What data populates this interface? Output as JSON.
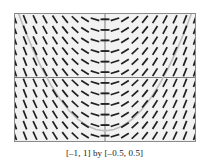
{
  "figure": {
    "caption": "[–1, 1] by [–0.5, 0.5]",
    "background_color": "#ffffff"
  },
  "chart_data": {
    "type": "scatter",
    "subtype": "slope-field",
    "title": "",
    "xlabel": "",
    "ylabel": "",
    "xlim": [
      -1,
      1
    ],
    "ylim": [
      -0.5,
      0.5
    ],
    "grid": false,
    "legend": null,
    "plot_background_color": "#f2f2f2",
    "frame_color": "#8a8a8a",
    "segment_color": "#1f1f1f",
    "curve_color": "#bdbdbd",
    "axes": {
      "x_axis_at_y": 0,
      "y_axis_at_x": 0,
      "axis_color": "#7d7d7d",
      "x_tick_count": 0,
      "y_tick_count": 11,
      "tick_color": "#555555"
    },
    "slope_field": {
      "equation": "dy/dx = 2x",
      "nx": 19,
      "ny": 12,
      "x_values": [
        -1,
        -0.889,
        -0.778,
        -0.667,
        -0.556,
        -0.444,
        -0.333,
        -0.222,
        -0.111,
        0,
        0.111,
        0.222,
        0.333,
        0.444,
        0.556,
        0.667,
        0.778,
        0.889,
        1
      ],
      "y_values": [
        0.458,
        0.375,
        0.292,
        0.208,
        0.125,
        0.042,
        -0.042,
        -0.125,
        -0.208,
        -0.292,
        -0.375,
        -0.458
      ],
      "slopes_by_x": [
        -2,
        -1.778,
        -1.556,
        -1.333,
        -1.111,
        -0.889,
        -0.667,
        -0.444,
        -0.222,
        0,
        0.222,
        0.444,
        0.667,
        0.889,
        1.111,
        1.333,
        1.556,
        1.778,
        2
      ],
      "segment_length_px": 9
    },
    "solution_curve": {
      "equation": "y = x^2 - 0.42",
      "vertex": [
        0,
        -0.42
      ],
      "points_x": [
        -1,
        -0.9,
        -0.8,
        -0.7,
        -0.6,
        -0.5,
        -0.4,
        -0.3,
        -0.2,
        -0.1,
        0,
        0.1,
        0.2,
        0.3,
        0.4,
        0.5,
        0.6,
        0.7,
        0.8,
        0.9,
        1
      ],
      "points_y": [
        0.58,
        0.39,
        0.22,
        0.07,
        -0.06,
        -0.17,
        -0.26,
        -0.33,
        -0.38,
        -0.41,
        -0.42,
        -0.41,
        -0.38,
        -0.33,
        -0.26,
        -0.17,
        -0.06,
        0.07,
        0.22,
        0.39,
        0.58
      ]
    },
    "y_ticks": [
      -0.458,
      -0.375,
      -0.292,
      -0.208,
      -0.125,
      -0.042,
      0.042,
      0.125,
      0.208,
      0.292,
      0.375,
      0.458
    ]
  }
}
